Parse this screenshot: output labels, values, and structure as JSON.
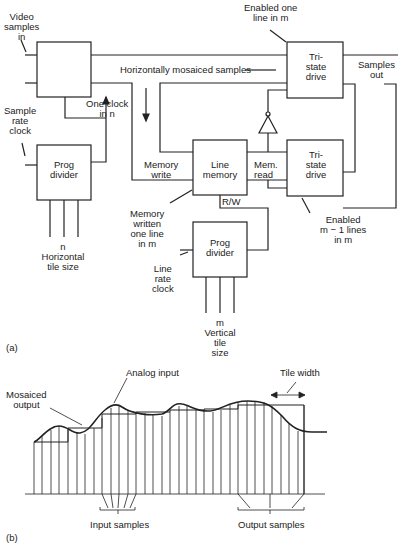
{
  "diagram_a": {
    "panel_label": "(a)",
    "video_in": [
      "Video",
      "samples",
      "in"
    ],
    "sample_rate_clock": [
      "Sample",
      "rate",
      "clock"
    ],
    "one_clock": [
      "One clock",
      "in n"
    ],
    "h_mosaiced": "Horizontally mosaiced samples",
    "enabled_one": [
      "Enabled one",
      "line in m"
    ],
    "tristate1": [
      "Tri-",
      "state",
      "drive"
    ],
    "samples_out": [
      "Samples",
      "out"
    ],
    "prog_divider_h": [
      "Prog",
      "divider"
    ],
    "h_tile": [
      "n",
      "Horizontal",
      "tile size"
    ],
    "memory_write": [
      "Memory",
      "write"
    ],
    "line_memory": [
      "Line",
      "memory"
    ],
    "mem_read": [
      "Mem.",
      "read"
    ],
    "tristate2": [
      "Tri-",
      "state",
      "drive"
    ],
    "rw": "R/W",
    "mem_written": [
      "Memory",
      "written",
      "one line",
      "in m"
    ],
    "enabled_m1": [
      "Enabled",
      "m − 1 lines",
      "in m"
    ],
    "line_rate_clock": [
      "Line",
      "rate",
      "clock"
    ],
    "prog_divider_v": [
      "Prog",
      "divider"
    ],
    "v_tile": [
      "m",
      "Vertical",
      "tile",
      "size"
    ]
  },
  "diagram_b": {
    "panel_label": "(b)",
    "analog_input": "Analog input",
    "tile_width": "Tile width",
    "mosaiced_output": [
      "Mosaiced",
      "output"
    ],
    "input_samples": "Input samples",
    "output_samples": "Output samples"
  }
}
